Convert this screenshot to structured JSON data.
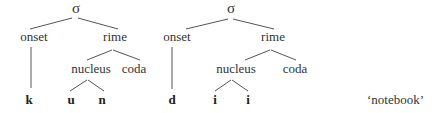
{
  "trees": [
    {
      "root": "σ",
      "onset_label": "onset",
      "rime_label": "rime",
      "nucleus_label": "nucleus",
      "coda_label": "coda",
      "segments": {
        "onset": "k",
        "nucleus_1": "u",
        "nucleus_2": "n"
      }
    },
    {
      "root": "σ",
      "onset_label": "onset",
      "rime_label": "rime",
      "nucleus_label": "nucleus",
      "coda_label": "coda",
      "segments": {
        "onset": "d",
        "nucleus_1": "i",
        "nucleus_2": "i"
      }
    }
  ],
  "gloss": "‘notebook’"
}
